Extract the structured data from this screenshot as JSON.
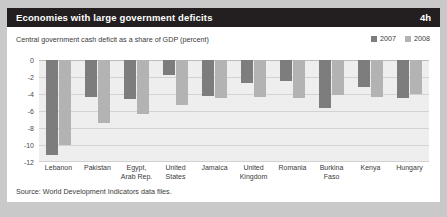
{
  "header": {
    "title": "Economies with large government deficits",
    "number": "4h"
  },
  "subtitle": "Central government cash deficit as a share of GDP (percent)",
  "legend": [
    {
      "label": "2007",
      "color": "#7d7d7d"
    },
    {
      "label": "2008",
      "color": "#b3b3b3"
    }
  ],
  "source": "Source: World Development Indicators data files.",
  "colors": {
    "header_bg": "#231f20",
    "page_bg": "#c9c9c9",
    "panel_bg": "#ffffff",
    "plot_bg": "#eeeeee",
    "series_2007": "#7d7d7d",
    "series_2008": "#b3b3b3",
    "grid": "#d2d2d2"
  },
  "chart_data": {
    "type": "bar",
    "title": "Economies with large government deficits",
    "subtitle": "Central government cash deficit as a share of GDP (percent)",
    "xlabel": "",
    "ylabel": "",
    "ylim": [
      -12,
      0
    ],
    "yticks": [
      0,
      -2,
      -4,
      -6,
      -8,
      -10,
      -12
    ],
    "ytick_labels": [
      "0",
      "-2",
      "-4",
      "-6",
      "-8",
      "-10",
      "-12"
    ],
    "grid": true,
    "legend_position": "top-right",
    "categories": [
      "Lebanon",
      "Pakistan",
      "Egypt, Arab Rep.",
      "United States",
      "Jamaica",
      "United Kingdom",
      "Romania",
      "Burkina Faso",
      "Kenya",
      "Hungary"
    ],
    "category_lines": [
      [
        "Lebanon"
      ],
      [
        "Pakistan"
      ],
      [
        "Egypt,",
        "Arab Rep."
      ],
      [
        "United",
        "States"
      ],
      [
        "Jamaica"
      ],
      [
        "United",
        "Kingdom"
      ],
      [
        "Romania"
      ],
      [
        "Burkina",
        "Faso"
      ],
      [
        "Kenya"
      ],
      [
        "Hungary"
      ]
    ],
    "series": [
      {
        "name": "2007",
        "color": "#7d7d7d",
        "values": [
          -11.2,
          -4.3,
          -4.6,
          -1.8,
          -4.2,
          -2.7,
          -2.5,
          -5.6,
          -3.2,
          -4.5
        ]
      },
      {
        "name": "2008",
        "color": "#b3b3b3",
        "values": [
          -10.0,
          -7.4,
          -6.3,
          -5.3,
          -4.5,
          -4.4,
          -4.5,
          -4.1,
          -4.4,
          -4.0
        ]
      }
    ],
    "source": "Source: World Development Indicators data files."
  }
}
